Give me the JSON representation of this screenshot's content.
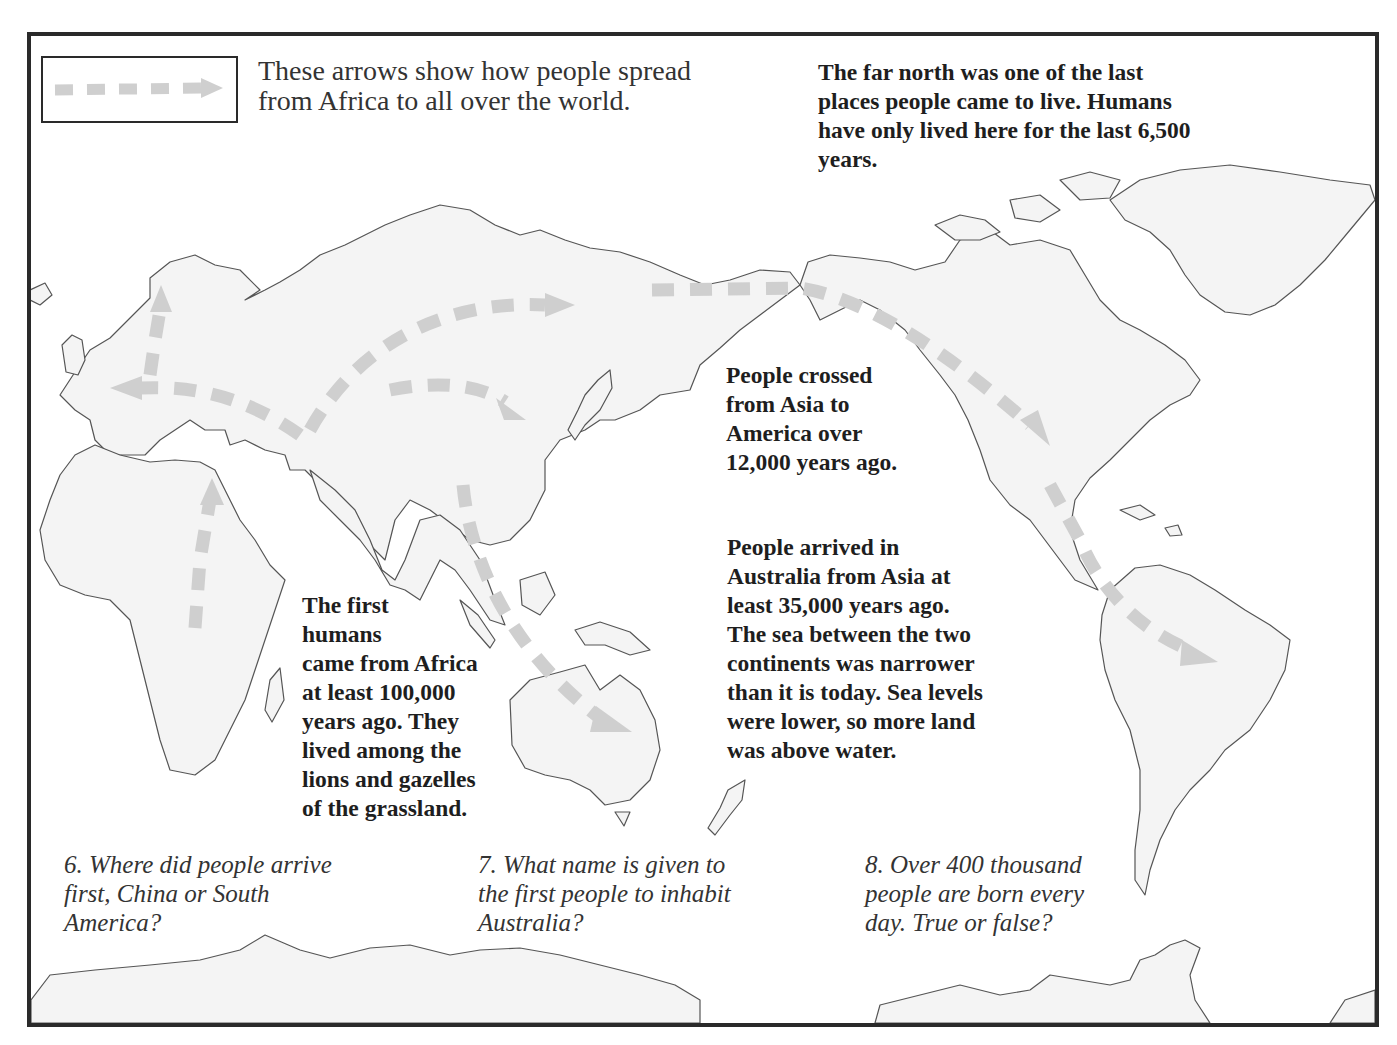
{
  "legend": {
    "icon": "dashed-arrow-icon",
    "lines": [
      "These arrows show how people spread",
      "from Africa to all over the world."
    ]
  },
  "facts": {
    "far_north": {
      "lines": [
        "The far north was one of the last",
        "places people came to live. Humans",
        "have only lived here for the last 6,500",
        "years."
      ]
    },
    "asia_to_america": {
      "lines": [
        "People crossed",
        "from Asia to",
        "America over",
        "12,000 years ago."
      ]
    },
    "australia": {
      "lines": [
        "People arrived in",
        "Australia from Asia at",
        "least 35,000 years ago.",
        "The sea between the two",
        "continents was narrower",
        "than it is today. Sea levels",
        "were lower, so more land",
        "was above water."
      ]
    },
    "africa": {
      "lines": [
        "The first",
        "humans",
        "came from Africa",
        "at least 100,000",
        "years ago. They",
        "lived among the",
        "lions and gazelles",
        "of the grassland."
      ]
    }
  },
  "questions": [
    {
      "number": "6",
      "lines": [
        "6. Where did people arrive",
        "first, China or South",
        "America?"
      ]
    },
    {
      "number": "7",
      "lines": [
        "7. What name is given to",
        "the first people to inhabit",
        "Australia?"
      ]
    },
    {
      "number": "8",
      "lines": [
        "8. Over 400 thousand",
        "people are born every",
        "day. True or false?"
      ]
    }
  ],
  "map": {
    "regions": [
      "Africa",
      "Europe",
      "Asia",
      "Australia",
      "North America",
      "Greenland",
      "South America",
      "Antarctica"
    ],
    "routes": [
      "Africa to Middle East",
      "Middle East to Europe (west)",
      "Europe to Scandinavia (north)",
      "Middle East to Siberia (northeast)",
      "Central Asia to East Asia",
      "East Asia to Australia",
      "Siberia to Alaska (Bering crossing)",
      "North America to South America"
    ],
    "colors": {
      "land": "#f4f4f4",
      "outline": "#555555",
      "route": "#cfcfcf",
      "frame": "#2a2a2a"
    }
  }
}
